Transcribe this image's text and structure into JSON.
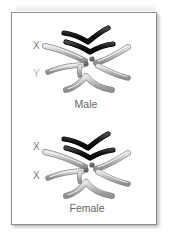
{
  "panels": [
    {
      "caption": "Male",
      "labels": [
        {
          "text": "X",
          "color": "#777777"
        },
        {
          "text": "Y",
          "color": "#b8b8b8"
        }
      ]
    },
    {
      "caption": "Female",
      "labels": [
        {
          "text": "X",
          "color": "#777777"
        },
        {
          "text": "X",
          "color": "#777777"
        }
      ]
    }
  ],
  "colors": {
    "sex_chromosome_dark": "#141414",
    "autosome_gray": "#a9a9a9",
    "autosome_highlight": "#e6e6e6",
    "centromere": "#6f6f6f",
    "border": "#8c8c8c"
  }
}
